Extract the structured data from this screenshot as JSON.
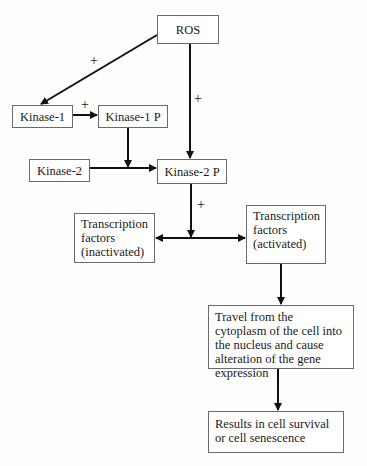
{
  "diagram": {
    "nodes": {
      "ros": "ROS",
      "kinase1": "Kinase-1",
      "kinase1p": "Kinase-1 P",
      "kinase2": "Kinase-2",
      "kinase2p": "Kinase-2 P",
      "tf_inactive": "Transcription factors (inactivated)",
      "tf_active": "Transcription factors (activated)",
      "travel": "Travel from the cytoplasm of the cell into the nucleus and cause alteration of the gene expression",
      "results": "Results in cell survival or cell senescence"
    },
    "edge_labels": {
      "ros_to_kinase1": "+",
      "ros_to_kinase2p": "+",
      "kinase1_to_kinase1p": "+",
      "kinase2p_to_tf": "+"
    },
    "edges": [
      {
        "from": "ROS",
        "to": "Kinase-1",
        "label": "+"
      },
      {
        "from": "ROS",
        "to": "Kinase-2 P",
        "label": "+"
      },
      {
        "from": "Kinase-1",
        "to": "Kinase-1 P",
        "label": "+"
      },
      {
        "from": "Kinase-1 P",
        "to": "Kinase-2 -> Kinase-2 P edge"
      },
      {
        "from": "Kinase-2",
        "to": "Kinase-2 P"
      },
      {
        "from": "Kinase-2 P",
        "to": "Transcription factors (inactivated) <-> (activated)",
        "label": "+"
      },
      {
        "from": "Transcription factors (activated)",
        "to": "Travel from the cytoplasm..."
      },
      {
        "from": "Travel from the cytoplasm...",
        "to": "Results in cell survival or cell senescence"
      }
    ]
  }
}
